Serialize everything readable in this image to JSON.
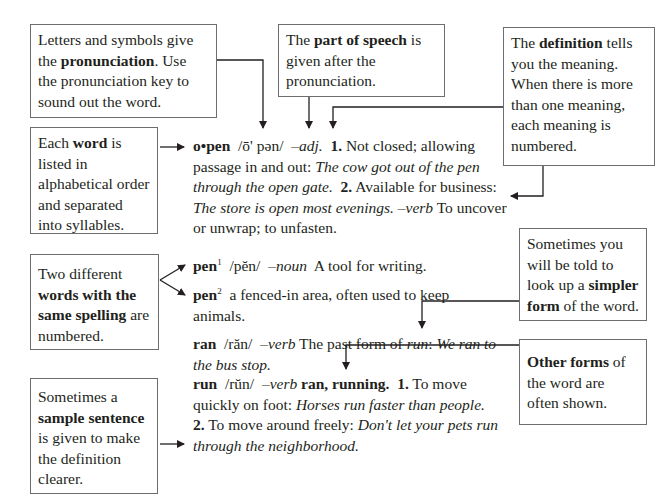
{
  "callouts": {
    "pronunciation": {
      "pre": "Letters and symbols give the ",
      "bold": "pronunciation",
      "post": ". Use the pronunciation key to sound out the word."
    },
    "part_of_speech": {
      "pre": "The ",
      "bold": "part of speech",
      "post": " is given after the pronunciation."
    },
    "definition": {
      "pre": "The ",
      "bold": "definition",
      "post": " tells you the meaning. When there is more than one meaning, each meaning is numbered."
    },
    "word": {
      "pre": "Each ",
      "bold": "word",
      "post": " is listed in alphabetical order and separated into syllables."
    },
    "same_spelling": {
      "pre": "Two different ",
      "bold": "words with the same spelling",
      "post": " are numbered."
    },
    "simpler_form": {
      "pre": "Sometimes you will be told to look up a ",
      "bold": "simpler form",
      "post": " of the word."
    },
    "other_forms": {
      "pre": "",
      "bold": "Other forms",
      "post": " of the word are often shown."
    },
    "sample_sentence": {
      "pre": "Sometimes a ",
      "bold": "sample sentence",
      "post": " is given to make the definition clearer."
    }
  },
  "entries": {
    "open": {
      "headword": "o•pen",
      "pronunciation": "/ō' pən/",
      "pos": "–adj.",
      "n1": "1.",
      "def1": " Not closed; allowing passage in and out: ",
      "ex1": "The cow got out of the pen through the open gate.",
      "n2": "2.",
      "def2": " Available for business: ",
      "ex2": "The store is open most evenings.",
      "pos2": " –verb",
      "def3": " To uncover or unwrap; to unfasten."
    },
    "pen1": {
      "headword": "pen",
      "sup": "1",
      "pronunciation": "/pĕn/",
      "pos": "–noun",
      "def": "A tool for writing."
    },
    "pen2": {
      "headword": "pen",
      "sup": "2",
      "def": "a fenced-in area, often used to keep animals."
    },
    "ran": {
      "headword": "ran",
      "pronunciation": "/răn/",
      "pos": "–verb",
      "def": " The past form of ",
      "ref": "run",
      "colon": ": ",
      "ex": "We ran to the bus stop."
    },
    "run": {
      "headword": "run",
      "pronunciation": "/rŭn/",
      "pos": "–verb",
      "forms": " ran, running.",
      "n1": "1.",
      "def1": " To move quickly on foot: ",
      "ex1": "Horses run faster than people.",
      "n2": "2.",
      "def2": " To move around freely: ",
      "ex2": "Don't let your pets run through the neighborhood."
    }
  },
  "colors": {
    "line": "#231f20",
    "border": "#6d6e70",
    "text": "#231f20"
  }
}
